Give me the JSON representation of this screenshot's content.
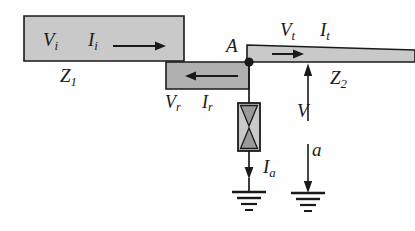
{
  "figure": {
    "kind": "circuit-diagram",
    "colors": {
      "line": "#1a1a1a",
      "fill_light": "#c9c9c9",
      "fill_mid": "#b0b0b0",
      "background": "#fefefe"
    }
  },
  "labels": {
    "incident_voltage": {
      "base": "V",
      "sub": "i"
    },
    "incident_current": {
      "base": "I",
      "sub": "i"
    },
    "impedance_1": {
      "base": "Z",
      "sub": "1"
    },
    "reflected_voltage": {
      "base": "V",
      "sub": "r"
    },
    "reflected_current": {
      "base": "I",
      "sub": "r"
    },
    "node": {
      "base": "A",
      "sub": ""
    },
    "transmitted_voltage": {
      "base": "V",
      "sub": "t"
    },
    "transmitted_current": {
      "base": "I",
      "sub": "t"
    },
    "impedance_2": {
      "base": "Z",
      "sub": "2"
    },
    "node_voltage": {
      "base": "V",
      "sub": ""
    },
    "arrester_current": {
      "base": "I",
      "sub": "a"
    },
    "arrester_branch": {
      "base": "a",
      "sub": ""
    }
  }
}
